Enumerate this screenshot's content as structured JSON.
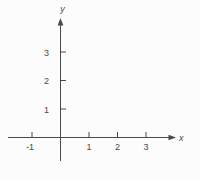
{
  "chart_data": {
    "type": "scatter",
    "title": "",
    "xlabel": "x",
    "ylabel": "y",
    "x_ticks": [
      -1,
      1,
      2,
      3
    ],
    "y_ticks": [
      1,
      2,
      3
    ],
    "xlim": [
      -1.85,
      4.05
    ],
    "ylim": [
      -0.85,
      4.2
    ],
    "series": [],
    "grid": false,
    "legend": "none",
    "axis_color": "#4a4a4a",
    "background": "#fcfcfc"
  }
}
